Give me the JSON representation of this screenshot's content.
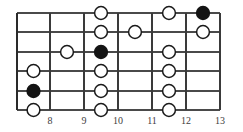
{
  "diagram": {
    "kind": "guitar-fretboard-diagram",
    "width": 243,
    "height": 132,
    "string_count": 6,
    "fret_count": 6,
    "colors": {
      "background": "#ffffff",
      "string": "#4a4a4a",
      "fret": "#3a3a3a",
      "nut": "#2a2a2a",
      "marker_outline": "#1a1a1a",
      "marker_open_fill": "#ffffff",
      "marker_root_fill": "#141414",
      "label": "#3d3d3d"
    },
    "geometry": {
      "left": 17,
      "right": 220,
      "top": 13,
      "bottom": 110,
      "fret_x": [
        17,
        50,
        84,
        118,
        152,
        186,
        220
      ],
      "string_y": [
        13,
        32,
        52,
        71,
        91,
        110
      ],
      "cell_centers_x": [
        33.5,
        67,
        101,
        135,
        169,
        203
      ],
      "marker_radius": 6.4,
      "label_y": 124
    },
    "fret_labels": [
      {
        "text": "8",
        "x": 50
      },
      {
        "text": "9",
        "x": 84
      },
      {
        "text": "10",
        "x": 118
      },
      {
        "text": "11",
        "x": 152
      },
      {
        "text": "12",
        "x": 186
      },
      {
        "text": "13",
        "x": 220
      }
    ],
    "markers": [
      {
        "string": 4,
        "cell": 0,
        "style": "open",
        "cx": 33.5,
        "cy": 71
      },
      {
        "string": 5,
        "cell": 0,
        "style": "filled",
        "cx": 33.5,
        "cy": 91
      },
      {
        "string": 6,
        "cell": 0,
        "style": "open",
        "cx": 33.5,
        "cy": 110
      },
      {
        "string": 3,
        "cell": 1,
        "style": "open",
        "cx": 67,
        "cy": 52
      },
      {
        "string": 1,
        "cell": 2,
        "style": "open",
        "cx": 101,
        "cy": 13
      },
      {
        "string": 2,
        "cell": 2,
        "style": "open",
        "cx": 101,
        "cy": 32
      },
      {
        "string": 3,
        "cell": 2,
        "style": "filled",
        "cx": 101,
        "cy": 52
      },
      {
        "string": 4,
        "cell": 2,
        "style": "open",
        "cx": 101,
        "cy": 71
      },
      {
        "string": 5,
        "cell": 2,
        "style": "open",
        "cx": 101,
        "cy": 91
      },
      {
        "string": 6,
        "cell": 2,
        "style": "open",
        "cx": 101,
        "cy": 110
      },
      {
        "string": 2,
        "cell": 3,
        "style": "open",
        "cx": 135,
        "cy": 32
      },
      {
        "string": 1,
        "cell": 4,
        "style": "open",
        "cx": 169,
        "cy": 13
      },
      {
        "string": 3,
        "cell": 4,
        "style": "open",
        "cx": 169,
        "cy": 52
      },
      {
        "string": 4,
        "cell": 4,
        "style": "open",
        "cx": 169,
        "cy": 71
      },
      {
        "string": 5,
        "cell": 4,
        "style": "open",
        "cx": 169,
        "cy": 91
      },
      {
        "string": 6,
        "cell": 4,
        "style": "open",
        "cx": 169,
        "cy": 110
      },
      {
        "string": 1,
        "cell": 5,
        "style": "filled",
        "cx": 203,
        "cy": 13
      },
      {
        "string": 2,
        "cell": 5,
        "style": "open",
        "cx": 203,
        "cy": 32
      }
    ]
  }
}
